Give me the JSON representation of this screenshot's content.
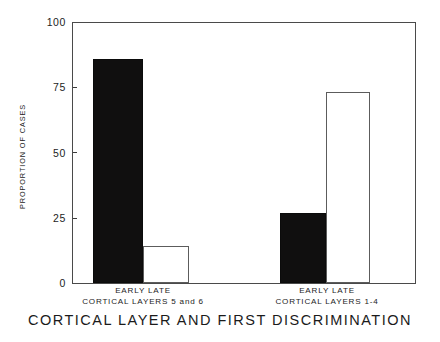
{
  "chart_data": {
    "type": "bar",
    "title": "CORTICAL LAYER AND FIRST DISCRIMINATION",
    "xlabel": "",
    "ylabel": "PROPORTION OF CASES",
    "ylim": [
      0,
      100
    ],
    "yticks": [
      0,
      25,
      50,
      75,
      100
    ],
    "ytick_labels": [
      "0",
      "25",
      "50",
      "75",
      "100"
    ],
    "grid": false,
    "legend": "none",
    "categories": [
      "EARLY",
      "LATE"
    ],
    "groups": [
      {
        "label_line1": "EARLY    LATE",
        "label_line2": "CORTICAL  LAYERS  5 and 6",
        "bars": [
          {
            "category": "EARLY",
            "value": 86,
            "style": "filled"
          },
          {
            "category": "LATE",
            "value": 14,
            "style": "open"
          }
        ]
      },
      {
        "label_line1": "EARLY    LATE",
        "label_line2": "CORTICAL  LAYERS  1-4",
        "bars": [
          {
            "category": "EARLY",
            "value": 27,
            "style": "filled"
          },
          {
            "category": "LATE",
            "value": 73,
            "style": "open"
          }
        ]
      }
    ],
    "series": [
      {
        "name": "EARLY",
        "values": [
          86,
          27
        ]
      },
      {
        "name": "LATE",
        "values": [
          14,
          73
        ]
      }
    ]
  },
  "axis": {
    "y_title": "PROPORTION OF CASES",
    "tick_100": "100",
    "tick_75": "75",
    "tick_50": "50",
    "tick_25": "25",
    "tick_0": "0"
  },
  "groups": {
    "left": {
      "row1": "EARLY    LATE",
      "row2": "CORTICAL  LAYERS  5 and 6"
    },
    "right": {
      "row1": "EARLY    LATE",
      "row2": "CORTICAL  LAYERS  1-4"
    }
  },
  "title": "CORTICAL LAYER AND FIRST DISCRIMINATION",
  "colors": {
    "bar_filled": "#100f0f",
    "bar_open_fill": "#ffffff",
    "bar_open_border": "#5c5c5c",
    "axis": "#4a4a4a",
    "text": "#1b1b1b",
    "background": "#ffffff"
  }
}
